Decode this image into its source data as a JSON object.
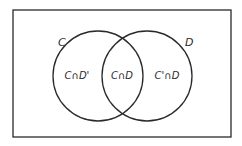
{
  "diagram": {
    "type": "venn",
    "universe": {
      "x": 13,
      "y": 10,
      "width": 218,
      "height": 127
    },
    "sets": [
      {
        "name": "C",
        "label": "C",
        "cx": 98,
        "cy": 76,
        "r": 45,
        "label_x": 58,
        "label_y": 46
      },
      {
        "name": "D",
        "label": "D",
        "label_x": 185,
        "label_y": 46,
        "cx": 147,
        "cy": 76,
        "r": 45
      }
    ],
    "regions": [
      {
        "name": "c-and-not-d",
        "label": "C∩D'",
        "x": 77,
        "y": 79
      },
      {
        "name": "c-and-d",
        "label": "C∩D",
        "x": 122,
        "y": 79
      },
      {
        "name": "not-c-and-d",
        "label": "C'∩D",
        "x": 167,
        "y": 79
      }
    ],
    "colors": {
      "stroke": "#2a2a2a",
      "background": "#ffffff"
    }
  }
}
